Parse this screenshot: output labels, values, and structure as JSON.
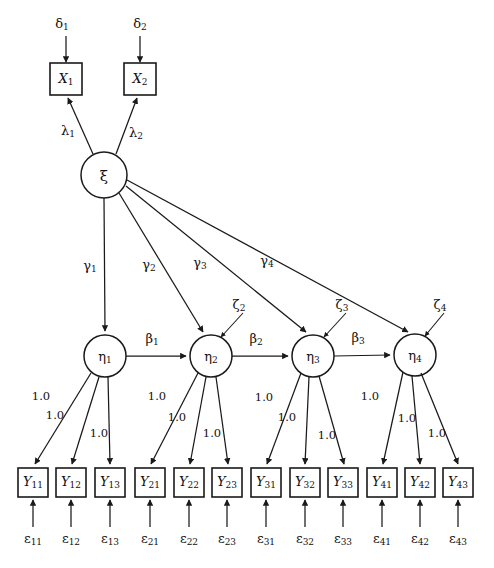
{
  "diagram": {
    "type": "path-diagram",
    "ink_color": "#1a1a1a",
    "background": "#ffffff",
    "exogenous_latent": {
      "name": "xi",
      "label": "ξ",
      "cx": 104,
      "cy": 175,
      "r": 23
    },
    "x_indicators": [
      {
        "label": "X",
        "sub": "1",
        "cx": 66,
        "cy": 79,
        "w": 32,
        "h": 32
      },
      {
        "label": "X",
        "sub": "2",
        "cx": 140,
        "cy": 79,
        "w": 32,
        "h": 32
      }
    ],
    "delta_errors": [
      {
        "label": "δ",
        "sub": "1",
        "x": 62,
        "y": 24
      },
      {
        "label": "δ",
        "sub": "2",
        "x": 140,
        "y": 24
      }
    ],
    "lambda_labels": [
      {
        "label": "λ",
        "sub": "1",
        "x": 68,
        "y": 131
      },
      {
        "label": "λ",
        "sub": "2",
        "x": 136,
        "y": 133
      }
    ],
    "eta_factors": [
      {
        "label": "η",
        "sub": "1",
        "cx": 105,
        "cy": 356,
        "r": 21
      },
      {
        "label": "η",
        "sub": "2",
        "cx": 211,
        "cy": 356,
        "r": 21
      },
      {
        "label": "η",
        "sub": "3",
        "cx": 313,
        "cy": 356,
        "r": 21
      },
      {
        "label": "η",
        "sub": "4",
        "cx": 415,
        "cy": 355,
        "r": 21
      }
    ],
    "gamma_labels": [
      {
        "label": "γ",
        "sub": "1",
        "x": 90,
        "y": 266
      },
      {
        "label": "γ",
        "sub": "2",
        "x": 149,
        "y": 265
      },
      {
        "label": "γ",
        "sub": "3",
        "x": 200,
        "y": 263
      },
      {
        "label": "γ",
        "sub": "4",
        "x": 267,
        "y": 261
      }
    ],
    "beta_labels": [
      {
        "label": "β",
        "sub": "1",
        "x": 152,
        "y": 339
      },
      {
        "label": "β",
        "sub": "2",
        "x": 256,
        "y": 339
      },
      {
        "label": "β",
        "sub": "3",
        "x": 358,
        "y": 338
      }
    ],
    "zeta_errors": [
      {
        "label": "ζ",
        "sub": "2",
        "x": 239,
        "y": 305
      },
      {
        "label": "ζ",
        "sub": "3",
        "x": 342,
        "y": 305
      },
      {
        "label": "ζ",
        "sub": "4",
        "x": 440,
        "y": 305
      }
    ],
    "y_indicators": [
      {
        "label": "Y",
        "sub": "11",
        "cx": 33,
        "cy": 482,
        "w": 30,
        "h": 29
      },
      {
        "label": "Y",
        "sub": "12",
        "cx": 71,
        "cy": 482,
        "w": 30,
        "h": 29
      },
      {
        "label": "Y",
        "sub": "13",
        "cx": 110,
        "cy": 482,
        "w": 30,
        "h": 29
      },
      {
        "label": "Y",
        "sub": "21",
        "cx": 150,
        "cy": 482,
        "w": 30,
        "h": 29
      },
      {
        "label": "Y",
        "sub": "22",
        "cx": 189,
        "cy": 482,
        "w": 30,
        "h": 29
      },
      {
        "label": "Y",
        "sub": "23",
        "cx": 227,
        "cy": 482,
        "w": 30,
        "h": 29
      },
      {
        "label": "Y",
        "sub": "31",
        "cx": 266,
        "cy": 482,
        "w": 30,
        "h": 29
      },
      {
        "label": "Y",
        "sub": "32",
        "cx": 305,
        "cy": 482,
        "w": 30,
        "h": 29
      },
      {
        "label": "Y",
        "sub": "33",
        "cx": 343,
        "cy": 482,
        "w": 30,
        "h": 29
      },
      {
        "label": "Y",
        "sub": "41",
        "cx": 382,
        "cy": 482,
        "w": 30,
        "h": 29
      },
      {
        "label": "Y",
        "sub": "42",
        "cx": 420,
        "cy": 482,
        "w": 30,
        "h": 29
      },
      {
        "label": "Y",
        "sub": "43",
        "cx": 458,
        "cy": 482,
        "w": 30,
        "h": 29
      }
    ],
    "epsilon_errors": [
      {
        "label": "ε",
        "sub": "11",
        "x": 33,
        "y": 539
      },
      {
        "label": "ε",
        "sub": "12",
        "x": 71,
        "y": 539
      },
      {
        "label": "ε",
        "sub": "13",
        "x": 110,
        "y": 539
      },
      {
        "label": "ε",
        "sub": "21",
        "x": 150,
        "y": 539
      },
      {
        "label": "ε",
        "sub": "22",
        "x": 189,
        "y": 539
      },
      {
        "label": "ε",
        "sub": "23",
        "x": 227,
        "y": 539
      },
      {
        "label": "ε",
        "sub": "31",
        "x": 266,
        "y": 539
      },
      {
        "label": "ε",
        "sub": "32",
        "x": 305,
        "y": 539
      },
      {
        "label": "ε",
        "sub": "33",
        "x": 343,
        "y": 539
      },
      {
        "label": "ε",
        "sub": "41",
        "x": 382,
        "y": 539
      },
      {
        "label": "ε",
        "sub": "42",
        "x": 420,
        "y": 539
      },
      {
        "label": "ε",
        "sub": "43",
        "x": 458,
        "y": 539
      }
    ],
    "loading_labels": [
      {
        "text": "1.0",
        "x": 41,
        "y": 397
      },
      {
        "text": "1.0",
        "x": 55,
        "y": 416
      },
      {
        "text": "1.0",
        "x": 99,
        "y": 434
      },
      {
        "text": "1.0",
        "x": 157,
        "y": 397
      },
      {
        "text": "1.0",
        "x": 177,
        "y": 418
      },
      {
        "text": "1.0",
        "x": 212,
        "y": 434
      },
      {
        "text": "1.0",
        "x": 264,
        "y": 398
      },
      {
        "text": "1.0",
        "x": 287,
        "y": 418
      },
      {
        "text": "1.0",
        "x": 327,
        "y": 436
      },
      {
        "text": "1.0",
        "x": 370,
        "y": 397
      },
      {
        "text": "1.0",
        "x": 407,
        "y": 419
      },
      {
        "text": "1.0",
        "x": 437,
        "y": 434
      }
    ]
  }
}
